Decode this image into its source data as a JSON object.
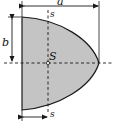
{
  "figure": {
    "colors": {
      "fill": "#c4c4c4",
      "stroke": "#1a1a1a",
      "background": "#ffffff"
    },
    "labels": {
      "width_dim": "a",
      "half_height_dim": "b",
      "centroid": "S",
      "axis_top": "s",
      "axis_bottom": "s"
    }
  }
}
